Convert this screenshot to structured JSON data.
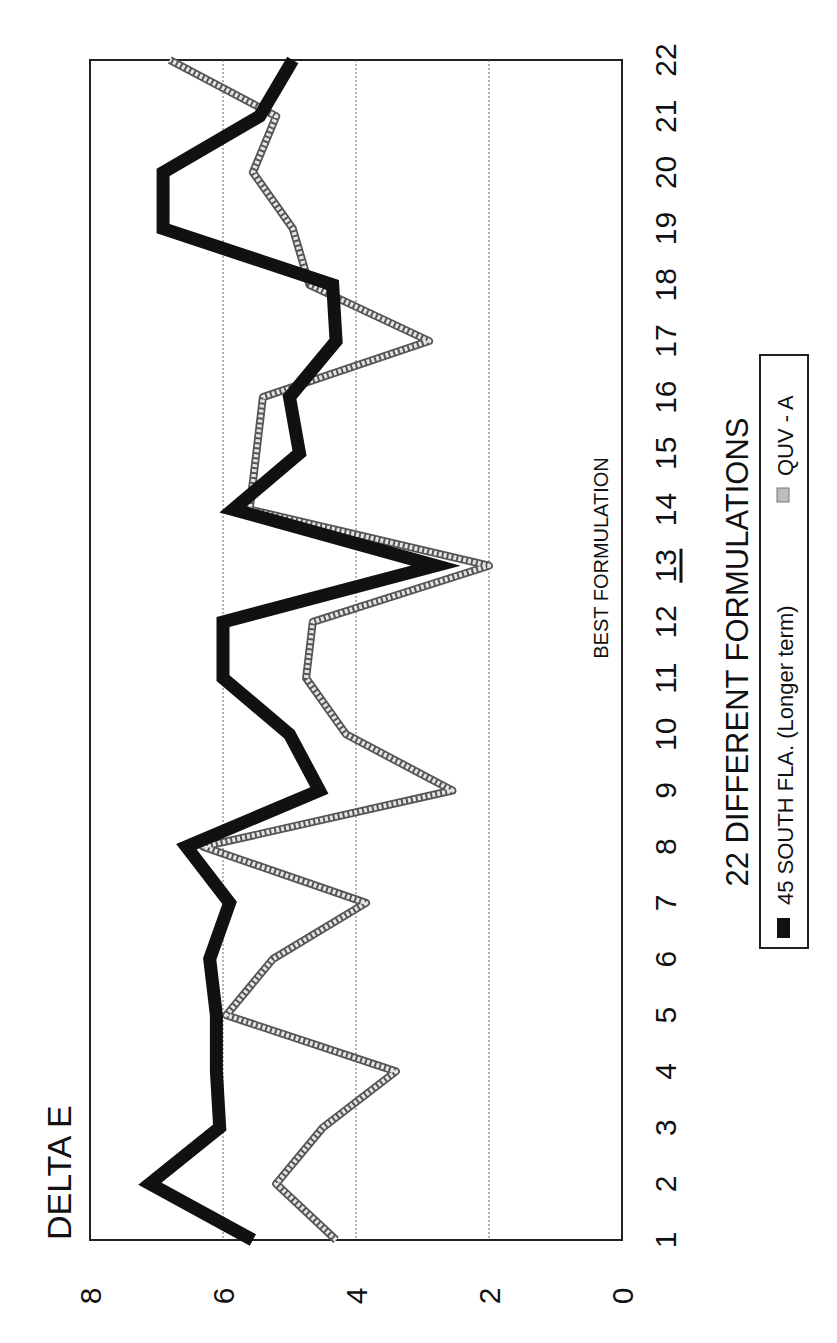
{
  "chart_data": {
    "type": "line",
    "orientation": "rotated-90-ccw",
    "title": "DELTA E",
    "xlabel": "22 DIFFERENT FORMULATIONS",
    "ylabel": "DELTA E",
    "categories": [
      "1",
      "2",
      "3",
      "4",
      "5",
      "6",
      "7",
      "8",
      "9",
      "10",
      "11",
      "12",
      "13",
      "14",
      "15",
      "16",
      "17",
      "18",
      "19",
      "20",
      "21",
      "22"
    ],
    "highlighted_category": "13",
    "ylim": [
      0,
      8
    ],
    "yticks": [
      "0",
      "2",
      "4",
      "6",
      "8"
    ],
    "grid": {
      "horizontal": true,
      "style": "dotted",
      "values": [
        2,
        4,
        6
      ]
    },
    "legend_position": "bottom",
    "annotations": [
      {
        "text": "BEST FORMULATION",
        "category": "13"
      }
    ],
    "series": [
      {
        "name": "45 SOUTH FLA. (Longer term)",
        "color": "#111111",
        "style": "thick-solid",
        "values": [
          5.55,
          7.1,
          6.05,
          6.1,
          6.1,
          6.2,
          5.9,
          6.55,
          4.55,
          5.0,
          6.0,
          6.0,
          2.8,
          5.85,
          4.85,
          5.0,
          4.3,
          4.35,
          6.9,
          6.9,
          5.45,
          4.95
        ]
      },
      {
        "name": "QUV - A",
        "color": "#9a9a9a",
        "style": "hatched-outline",
        "values": [
          4.3,
          5.2,
          4.5,
          3.4,
          5.95,
          5.25,
          3.85,
          6.3,
          2.55,
          4.15,
          4.75,
          4.65,
          2.0,
          5.6,
          5.5,
          5.4,
          2.9,
          4.7,
          4.95,
          5.55,
          5.2,
          6.8
        ]
      }
    ]
  },
  "labels": {
    "title": "DELTA E",
    "xaxis_title": "22 DIFFERENT FORMULATIONS",
    "annotation": "BEST FORMULATION",
    "legend_series_1": "45 SOUTH FLA.  (Longer term)",
    "legend_series_2": "QUV - A"
  }
}
